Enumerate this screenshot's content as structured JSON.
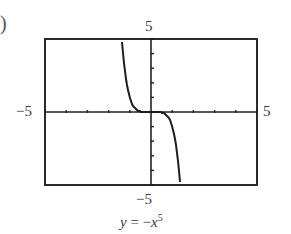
{
  "part_label": ")",
  "chart_data": {
    "type": "line",
    "title": "",
    "equation": "y = -x^5",
    "caption": {
      "lhs": "y",
      "eq": "=",
      "sign": "−",
      "var": "x",
      "exp": "5"
    },
    "xlim": [
      -5,
      5
    ],
    "ylim": [
      -5,
      5
    ],
    "xscale": 1,
    "yscale": 1,
    "grid": false,
    "tick_labels": {
      "xmin": "−5",
      "xmax": "5",
      "ymin": "−5",
      "ymax": "5"
    },
    "series": [
      {
        "name": "y = -x^5",
        "x": [
          -1.38,
          -1.3,
          -1.2,
          -1.1,
          -1.0,
          -0.9,
          -0.8,
          -0.6,
          -0.4,
          0,
          0.4,
          0.6,
          0.8,
          0.9,
          1.0,
          1.1,
          1.2,
          1.3,
          1.38
        ],
        "y": [
          5.0,
          3.71,
          2.49,
          1.61,
          1.0,
          0.59,
          0.33,
          0.08,
          0.01,
          0,
          -0.01,
          -0.08,
          -0.33,
          -0.59,
          -1.0,
          -1.61,
          -2.49,
          -3.71,
          -5.0
        ]
      }
    ]
  }
}
